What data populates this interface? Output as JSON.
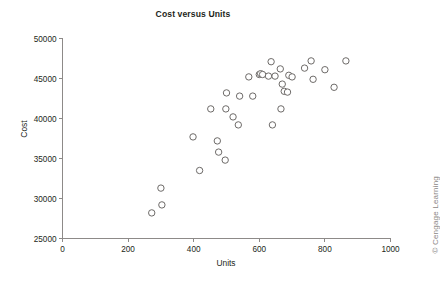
{
  "figure": {
    "top_cropped_text": "•",
    "credit": "© Cengage Learning"
  },
  "chart_data": {
    "type": "scatter",
    "title": "Cost versus Units",
    "xlabel": "Units",
    "ylabel": "Cost",
    "xlim": [
      0,
      1000
    ],
    "ylim": [
      25000,
      50000
    ],
    "xticks": [
      0,
      200,
      400,
      600,
      800,
      1000
    ],
    "yticks": [
      25000,
      30000,
      35000,
      40000,
      45000,
      50000
    ],
    "xtick_labels": [
      "0",
      "200",
      "400",
      "600",
      "800",
      "1000"
    ],
    "ytick_labels": [
      "25000",
      "30000",
      "35000",
      "40000",
      "45000",
      "50000"
    ],
    "grid": false,
    "legend": null,
    "marker": {
      "shape": "circle-open",
      "size": 3.2,
      "stroke": "#6d6a68",
      "fill": "#ffffff"
    },
    "series": [
      {
        "name": "Cost vs Units",
        "points": [
          [
            272,
            28200
          ],
          [
            300,
            31300
          ],
          [
            303,
            29200
          ],
          [
            398,
            37700
          ],
          [
            418,
            33500
          ],
          [
            452,
            41200
          ],
          [
            472,
            37200
          ],
          [
            476,
            35800
          ],
          [
            496,
            34800
          ],
          [
            498,
            41200
          ],
          [
            500,
            43200
          ],
          [
            520,
            40200
          ],
          [
            536,
            39200
          ],
          [
            540,
            42800
          ],
          [
            568,
            45200
          ],
          [
            580,
            42800
          ],
          [
            600,
            45500
          ],
          [
            604,
            45600
          ],
          [
            610,
            45500
          ],
          [
            628,
            45300
          ],
          [
            636,
            47100
          ],
          [
            640,
            39200
          ],
          [
            648,
            45300
          ],
          [
            664,
            46200
          ],
          [
            666,
            41200
          ],
          [
            670,
            44300
          ],
          [
            676,
            43400
          ],
          [
            686,
            43300
          ],
          [
            690,
            45400
          ],
          [
            700,
            45200
          ],
          [
            738,
            46300
          ],
          [
            758,
            47200
          ],
          [
            764,
            44900
          ],
          [
            800,
            46100
          ],
          [
            828,
            43900
          ],
          [
            864,
            47200
          ]
        ]
      }
    ]
  }
}
